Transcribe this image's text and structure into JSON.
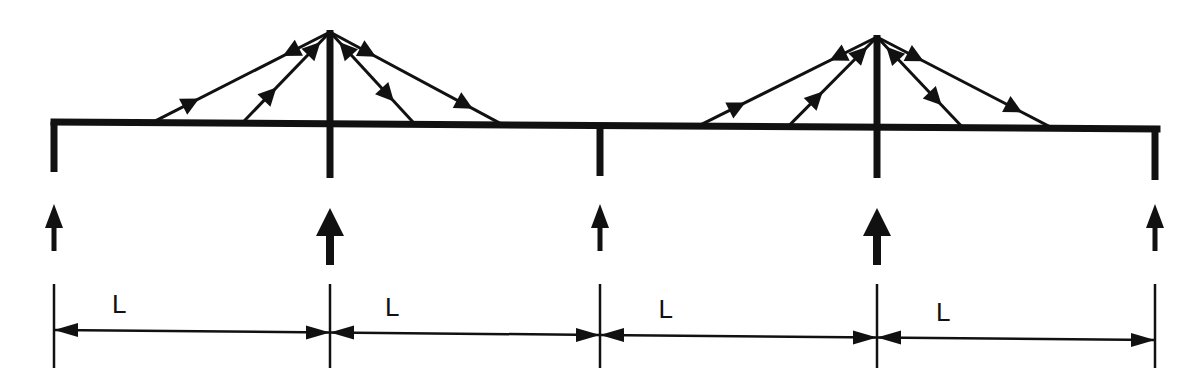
{
  "diagram": {
    "type": "cable-stayed bridge structural schematic",
    "ink_color": "#111111",
    "background": "#ffffff",
    "deck": {
      "start": [
        54,
        122
      ],
      "end": [
        1157,
        129
      ],
      "thickness": 7
    },
    "supports": [
      {
        "x": 54,
        "top": 122,
        "bottom": 172,
        "reaction": "small"
      },
      {
        "x": 330,
        "top": 124,
        "bottom": 178,
        "reaction": "large"
      },
      {
        "x": 600,
        "top": 126,
        "bottom": 176,
        "reaction": "small"
      },
      {
        "x": 877,
        "top": 127,
        "bottom": 178,
        "reaction": "large"
      },
      {
        "x": 1155,
        "top": 129,
        "bottom": 180,
        "reaction": "small"
      }
    ],
    "towers": [
      {
        "x": 330,
        "top": 30,
        "cable_anchors": [
          152,
          242,
          415,
          503
        ]
      },
      {
        "x": 877,
        "top": 35,
        "cable_anchors": [
          698,
          788,
          963,
          1053
        ]
      }
    ],
    "reactions": {
      "arrow_top": 202,
      "arrow_bottom": 252,
      "large_arrow_bottom": 266
    },
    "dimension": {
      "tick_top": 284,
      "tick_bottom": 368,
      "line_y_start": 330,
      "line_y_end": 340,
      "spans": [
        {
          "label": "L",
          "from": 54,
          "to": 330
        },
        {
          "label": "L",
          "from": 330,
          "to": 600
        },
        {
          "label": "L",
          "from": 600,
          "to": 877
        },
        {
          "label": "L",
          "from": 877,
          "to": 1155
        }
      ]
    }
  }
}
